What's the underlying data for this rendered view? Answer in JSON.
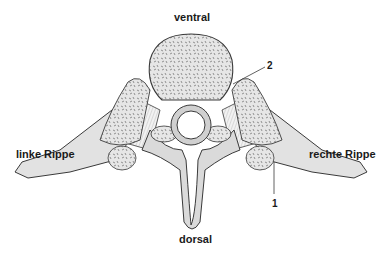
{
  "diagram": {
    "labels": {
      "top": "ventral",
      "bottom": "dorsal",
      "left": "linke Rippe",
      "right": "rechte Rippe"
    },
    "callouts": [
      {
        "number": "2"
      },
      {
        "number": "1"
      }
    ],
    "colors": {
      "bone_fill": "#e4e4e4",
      "bone_shadow": "#c8c8c8",
      "outline": "#3a3a3a",
      "trabecular": "#6a6a6a",
      "text": "#1a1a1a"
    }
  }
}
